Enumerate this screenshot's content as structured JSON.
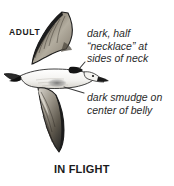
{
  "plate": {
    "subject": "shearwater-in-flight",
    "background_color": "#ffffff",
    "ink_color": "#1b1b1b"
  },
  "labels": {
    "age_label": "ADULT",
    "pose_label": "IN FLIGHT"
  },
  "callouts": [
    {
      "id": "necklace",
      "lines": [
        "dark, half",
        "“necklace” at",
        "sides of neck"
      ],
      "line1": "dark, half",
      "line2": "“necklace” at",
      "line3": "sides of neck",
      "leader": "points-left-down-to-neck-patch"
    },
    {
      "id": "belly-smudge",
      "lines": [
        "dark smudge on",
        "center of belly"
      ],
      "line1": "dark smudge on",
      "line2": "center of belly",
      "leader": "points-left-down-to-belly"
    }
  ],
  "illustration": {
    "name": "shearwater",
    "upper_wing": "raised-left-swept-dark-above",
    "lower_wing": "lowered-long-narrow-streaked",
    "body": "white-underparts",
    "tail": "dark-tipped-pointing-left",
    "neck_patch_color": "#151515",
    "belly_smudge_color": "#6f6f6f",
    "wing_dark_color": "#1e1e1e",
    "wing_mid_color": "#8a8376",
    "wing_light_color": "#d8d4cb"
  }
}
